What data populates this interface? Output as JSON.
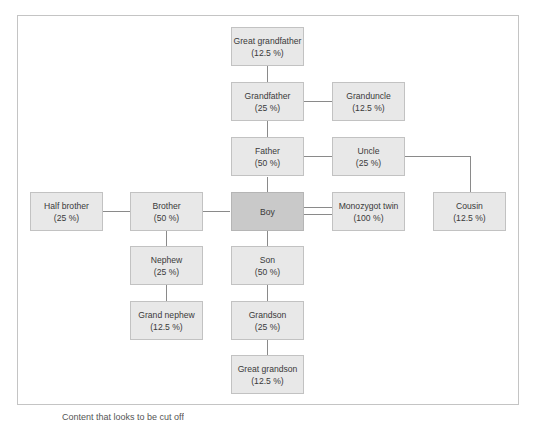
{
  "diagram": {
    "focal": {
      "name": "Boy"
    },
    "nodes": [
      {
        "id": "great_grandfather",
        "label": "Great grandfather",
        "pct": "(12.5 %)"
      },
      {
        "id": "grandfather",
        "label": "Grandfather",
        "pct": "(25 %)"
      },
      {
        "id": "granduncle",
        "label": "Granduncle",
        "pct": "(12.5 %)"
      },
      {
        "id": "father",
        "label": "Father",
        "pct": "(50 %)"
      },
      {
        "id": "uncle",
        "label": "Uncle",
        "pct": "(25 %)"
      },
      {
        "id": "cousin",
        "label": "Cousin",
        "pct": "(12.5 %)"
      },
      {
        "id": "half_brother",
        "label": "Half brother",
        "pct": "(25 %)"
      },
      {
        "id": "brother",
        "label": "Brother",
        "pct": "(50 %)"
      },
      {
        "id": "twin",
        "label": "Monozygot twin",
        "pct": "(100 %)"
      },
      {
        "id": "nephew",
        "label": "Nephew",
        "pct": "(25 %)"
      },
      {
        "id": "son",
        "label": "Son",
        "pct": "(50 %)"
      },
      {
        "id": "grand_nephew",
        "label": "Grand nephew",
        "pct": "(12.5 %)"
      },
      {
        "id": "grandson",
        "label": "Grandson",
        "pct": "(25 %)"
      },
      {
        "id": "great_grandson",
        "label": "Great grandson",
        "pct": "(12.5 %)"
      }
    ],
    "edges": [
      [
        "great_grandfather",
        "grandfather"
      ],
      [
        "grandfather",
        "granduncle"
      ],
      [
        "grandfather",
        "father"
      ],
      [
        "father",
        "uncle"
      ],
      [
        "uncle",
        "cousin"
      ],
      [
        "father",
        "boy"
      ],
      [
        "boy",
        "brother"
      ],
      [
        "brother",
        "half_brother"
      ],
      [
        "boy",
        "twin",
        "double"
      ],
      [
        "brother",
        "nephew"
      ],
      [
        "nephew",
        "grand_nephew"
      ],
      [
        "boy",
        "son"
      ],
      [
        "son",
        "grandson"
      ],
      [
        "grandson",
        "great_grandson"
      ]
    ],
    "colors": {
      "box_fill": "#e8e8e8",
      "focal_fill": "#c9c9c9",
      "border": "#c2c2c2",
      "line": "#8a8a8a"
    }
  },
  "caption": "Content that looks to be cut off"
}
